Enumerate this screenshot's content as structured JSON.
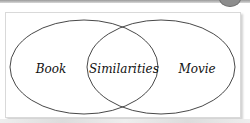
{
  "diagram": {
    "type": "venn",
    "sets": [
      {
        "label": "Book"
      },
      {
        "label": "Movie"
      }
    ],
    "intersection": {
      "label": "Similarities"
    },
    "colors": {
      "outline": "#333333",
      "frame_border": "#d9d9d9",
      "background": "#ffffff"
    }
  }
}
